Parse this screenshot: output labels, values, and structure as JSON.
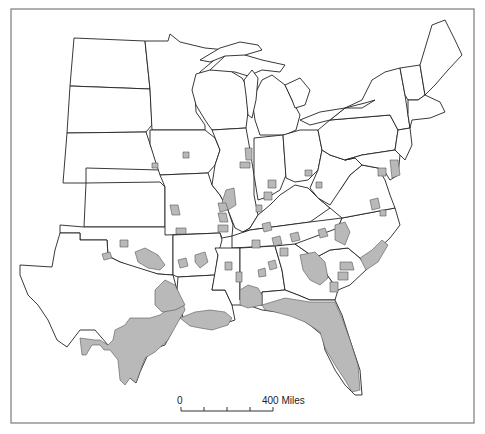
{
  "map": {
    "colors": {
      "shade": "#b9b9b9",
      "outline": "#222222",
      "frame": "#7a7a7a",
      "background": "#ffffff"
    },
    "scale_bar": {
      "start_label": "0",
      "end_label": "400 Miles",
      "ticks": 5
    },
    "states": [
      {
        "name": "north-dakota",
        "points": "74,38 145,41 150,89 70,86"
      },
      {
        "name": "south-dakota",
        "points": "70,86 150,89 152,125 146,132 67,133"
      },
      {
        "name": "nebraska",
        "points": "67,133 146,132 150,144 160,170 86,168 86,183 63,183"
      },
      {
        "name": "kansas",
        "points": "86,183 160,182 165,187 165,227 84,227"
      },
      {
        "name": "oklahoma",
        "points": "60,225 84,227 165,227 173,230 173,275 158,274 140,270 120,262 108,256 107,240 80,240 80,233 60,233"
      },
      {
        "name": "texas",
        "points": "60,233 80,233 80,240 107,240 108,256 120,262 158,274 173,275 177,290 180,300 185,310 175,325 165,345 150,350 140,372 136,383 130,378 122,363 108,345 95,330 80,330 67,347 57,340 48,320 38,305 28,295 20,275 20,265 52,267 55,250 60,233"
      },
      {
        "name": "minnesota",
        "points": "145,41 168,41 170,34 180,42 205,48 226,50 200,72 195,92 196,112 205,125 205,130 152,130 150,89"
      },
      {
        "name": "iowa",
        "points": "150,130 205,130 215,138 220,150 215,165 208,173 160,175 155,160 150,144"
      },
      {
        "name": "missouri",
        "points": "160,175 208,173 212,185 220,195 228,210 233,225 232,236 222,238 220,233 165,235 165,187"
      },
      {
        "name": "arkansas",
        "points": "173,235 220,233 222,240 218,255 215,275 178,277 173,275"
      },
      {
        "name": "louisiana",
        "points": "177,290 178,277 215,275 212,290 225,290 232,305 235,320 220,325 205,327 190,322 183,318 180,300"
      },
      {
        "name": "wisconsin",
        "points": "196,74 210,70 225,65 232,72 242,78 246,85 248,112 246,128 212,130 205,120 196,105 192,90"
      },
      {
        "name": "illinois",
        "points": "212,130 246,128 250,150 254,175 254,195 258,215 250,228 243,232 235,228 228,210 220,195 212,185 215,165 220,150"
      },
      {
        "name": "michigan-lower",
        "points": "252,100 262,80 272,75 285,85 292,100 300,115 296,130 285,135 260,135 255,120"
      },
      {
        "name": "michigan-upper",
        "points": "210,70 225,56 232,50 245,55 262,60 285,65 280,72 262,70 248,76 235,72"
      },
      {
        "name": "indiana",
        "points": "254,138 283,135 286,175 280,190 270,196 258,200 254,175"
      },
      {
        "name": "ohio",
        "points": "283,135 300,130 318,130 322,150 318,170 308,180 295,182 286,178"
      },
      {
        "name": "kentucky",
        "points": "243,232 250,228 258,215 270,205 280,195 295,185 308,188 318,198 330,208 310,222 250,230"
      },
      {
        "name": "tennessee",
        "points": "232,236 250,230 310,222 342,218 338,228 320,240 290,245 232,248"
      },
      {
        "name": "mississippi",
        "points": "215,248 232,248 240,248 240,300 245,305 232,305 225,290 212,290 218,255"
      },
      {
        "name": "alabama",
        "points": "240,248 275,246 282,270 285,290 262,292 262,305 248,305 245,305 240,300"
      },
      {
        "name": "georgia",
        "points": "275,246 295,244 315,258 325,272 338,290 335,300 310,300 298,295 285,290 282,270"
      },
      {
        "name": "florida",
        "points": "248,305 262,305 262,292 285,290 298,295 310,300 335,300 342,315 350,340 360,370 362,395 355,395 345,385 335,370 325,350 322,335 310,325 295,315 278,312 262,310"
      },
      {
        "name": "south-carolina",
        "points": "315,258 330,250 348,248 360,258 368,268 350,285 338,290 325,272"
      },
      {
        "name": "north-carolina",
        "points": "295,244 338,228 342,218 395,208 400,225 390,238 375,252 368,268 360,258 348,248 330,250 315,258"
      },
      {
        "name": "virginia",
        "points": "318,198 330,208 342,218 395,208 390,195 385,180 378,168 362,165 350,175 340,190"
      },
      {
        "name": "west-virginia",
        "points": "318,170 322,150 330,155 345,160 355,158 362,165 350,175 340,190 330,205 318,198 310,188"
      },
      {
        "name": "pennsylvania",
        "points": "318,130 330,120 390,115 398,130 395,150 362,155 345,160 330,155 322,150"
      },
      {
        "name": "new-york",
        "points": "330,120 345,108 362,100 372,80 385,72 400,68 405,95 408,115 410,128 398,130 390,115"
      },
      {
        "name": "maryland-delaware",
        "points": "345,160 362,155 395,150 400,155 398,175 390,180 385,172 378,168 362,165 355,158"
      },
      {
        "name": "new-jersey",
        "points": "395,150 398,130 410,128 412,145 405,160 400,155"
      },
      {
        "name": "vermont-nh",
        "points": "400,68 420,65 425,95 418,100 408,100 405,95"
      },
      {
        "name": "maine",
        "points": "420,65 432,25 445,20 455,40 462,55 448,70 435,85 425,95"
      },
      {
        "name": "mass-ri-ct",
        "points": "408,100 418,100 425,95 440,102 445,112 430,118 412,120 410,128 408,115"
      }
    ],
    "lakes": [
      {
        "name": "lake-michigan",
        "points": "244,80 252,70 258,78 256,100 252,118 248,115 246,95"
      },
      {
        "name": "lake-superior",
        "points": "200,60 220,48 240,42 258,45 262,50 245,55 225,56 210,62"
      },
      {
        "name": "lake-huron",
        "points": "285,85 300,78 310,90 305,105 295,108 292,100"
      },
      {
        "name": "lake-erie",
        "points": "300,120 320,112 345,108 330,120 310,125"
      },
      {
        "name": "lake-ontario",
        "points": "345,108 365,103 375,100 362,108"
      }
    ],
    "shaded_areas": [
      {
        "name": "south-texas",
        "points": "80,338 95,340 100,340 108,345 113,340 115,330 125,325 130,318 150,318 160,315 175,305 182,300 185,310 178,322 168,340 155,352 145,358 140,372 136,383 130,378 125,385 120,380 118,360 110,350 104,350 100,345 92,345 86,355 82,355"
      },
      {
        "name": "east-texas",
        "points": "155,290 165,280 175,285 180,295 185,305 175,310 162,312 155,305"
      },
      {
        "name": "louisiana-coast",
        "points": "180,318 195,312 210,310 225,312 232,318 228,325 212,330 200,328 190,326"
      },
      {
        "name": "gulf-alabama",
        "points": "240,290 248,285 258,288 262,295 262,305 248,308 240,305"
      },
      {
        "name": "florida-shade",
        "points": "262,305 285,298 310,302 335,302 342,318 350,340 358,365 360,390 352,392 345,380 335,365 325,348 320,332 305,322 290,316 275,312 265,310"
      },
      {
        "name": "georgia-central",
        "points": "300,255 315,252 325,262 328,278 320,285 310,280 303,270"
      },
      {
        "name": "carolina-coast",
        "points": "360,258 372,250 382,240 388,245 378,262 366,270"
      },
      {
        "name": "nc-piedmont",
        "points": "335,225 345,222 350,232 345,245 335,240"
      },
      {
        "name": "delmarva",
        "points": "390,160 398,160 400,175 392,178"
      },
      {
        "name": "east-oklahoma",
        "points": "135,252 145,248 158,255 165,265 160,270 148,268 138,262"
      },
      {
        "name": "ok-1",
        "points": "120,240 128,240 128,247 120,247"
      },
      {
        "name": "ok-2",
        "points": "102,254 110,252 112,258 104,260"
      },
      {
        "name": "ark-1",
        "points": "195,255 205,252 208,262 200,268 195,262"
      },
      {
        "name": "ark-2",
        "points": "178,260 186,258 188,266 180,268"
      },
      {
        "name": "miss-1",
        "points": "225,262 232,262 232,270 225,270"
      },
      {
        "name": "miss-2",
        "points": "236,272 242,272 242,282 236,282"
      },
      {
        "name": "ala-1",
        "points": "268,262 275,260 277,268 270,270"
      },
      {
        "name": "ala-2",
        "points": "258,270 265,268 266,276 259,277"
      },
      {
        "name": "il-1",
        "points": "226,190 234,188 236,205 228,210 222,202"
      },
      {
        "name": "il-2",
        "points": "218,203 226,203 228,210 220,212"
      },
      {
        "name": "il-3",
        "points": "218,213 226,213 228,222 220,222"
      },
      {
        "name": "il-4",
        "points": "245,148 252,148 252,160 246,160"
      },
      {
        "name": "il-5",
        "points": "240,162 250,162 250,168 240,168"
      },
      {
        "name": "mo-1",
        "points": "170,205 178,205 180,215 172,215"
      },
      {
        "name": "mo-2",
        "points": "176,228 186,228 186,234 176,234"
      },
      {
        "name": "mo-3",
        "points": "218,225 228,225 228,232 218,232"
      },
      {
        "name": "ia-1",
        "points": "183,152 189,152 189,158 183,158"
      },
      {
        "name": "ne-1",
        "points": "152,163 158,163 158,168 152,168"
      },
      {
        "name": "in-1",
        "points": "268,180 276,180 276,188 268,188"
      },
      {
        "name": "in-2",
        "points": "264,192 272,192 272,200 264,200"
      },
      {
        "name": "in-3",
        "points": "256,205 262,205 262,212 256,212"
      },
      {
        "name": "oh-1",
        "points": "305,170 312,170 312,176 305,176"
      },
      {
        "name": "oh-2",
        "points": "316,182 322,182 322,188 316,188"
      },
      {
        "name": "ky-1",
        "points": "262,224 270,222 272,230 264,232"
      },
      {
        "name": "ky-2",
        "points": "272,238 280,236 282,244 274,246"
      },
      {
        "name": "ky-3",
        "points": "290,234 298,232 300,240 292,242"
      },
      {
        "name": "tn-1",
        "points": "280,248 288,248 288,256 280,256"
      },
      {
        "name": "tn-2",
        "points": "252,240 260,240 260,248 252,248"
      },
      {
        "name": "tn-3",
        "points": "318,230 325,228 328,236 320,238"
      },
      {
        "name": "va-1",
        "points": "370,200 378,198 380,208 372,210"
      },
      {
        "name": "va-2",
        "points": "380,210 386,210 386,216 380,216"
      },
      {
        "name": "va-3",
        "points": "378,168 386,168 386,176 378,176"
      },
      {
        "name": "sc-1",
        "points": "340,262 352,262 354,270 340,270"
      },
      {
        "name": "sc-2",
        "points": "338,272 348,272 348,280 338,280"
      },
      {
        "name": "ga-1",
        "points": "330,282 338,282 338,292 330,292"
      }
    ]
  }
}
